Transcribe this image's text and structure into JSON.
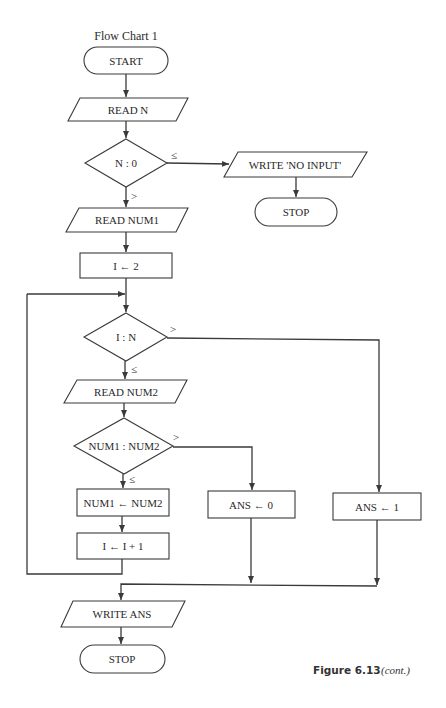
{
  "figure": {
    "title": "Flow Chart 1",
    "caption_number": "Figure 6.13",
    "caption_note": "(cont.)"
  },
  "nodes": {
    "start": "START",
    "read_n": "READ N",
    "check_n": "N : 0",
    "write_no_input": "WRITE 'NO INPUT'",
    "stop_1": "STOP",
    "read_num1": "READ NUM1",
    "init_i": "I ← 2",
    "check_i": "I : N",
    "read_num2": "READ NUM2",
    "compare": "NUM1 : NUM2",
    "assign_num1": "NUM1 ← NUM2",
    "increment_i": "I ← I + 1",
    "ans_zero": "ANS ← 0",
    "ans_one": "ANS ← 1",
    "write_ans": "WRITE ANS",
    "stop_2": "STOP"
  },
  "conditions": {
    "n_le": "≤",
    "n_gt": ">",
    "i_gt": ">",
    "i_le": "≤",
    "cmp_gt": ">",
    "cmp_le": "≤"
  },
  "colors": {
    "stroke": "#3a3a3a",
    "text": "#2a2a2a",
    "background": "#ffffff"
  }
}
